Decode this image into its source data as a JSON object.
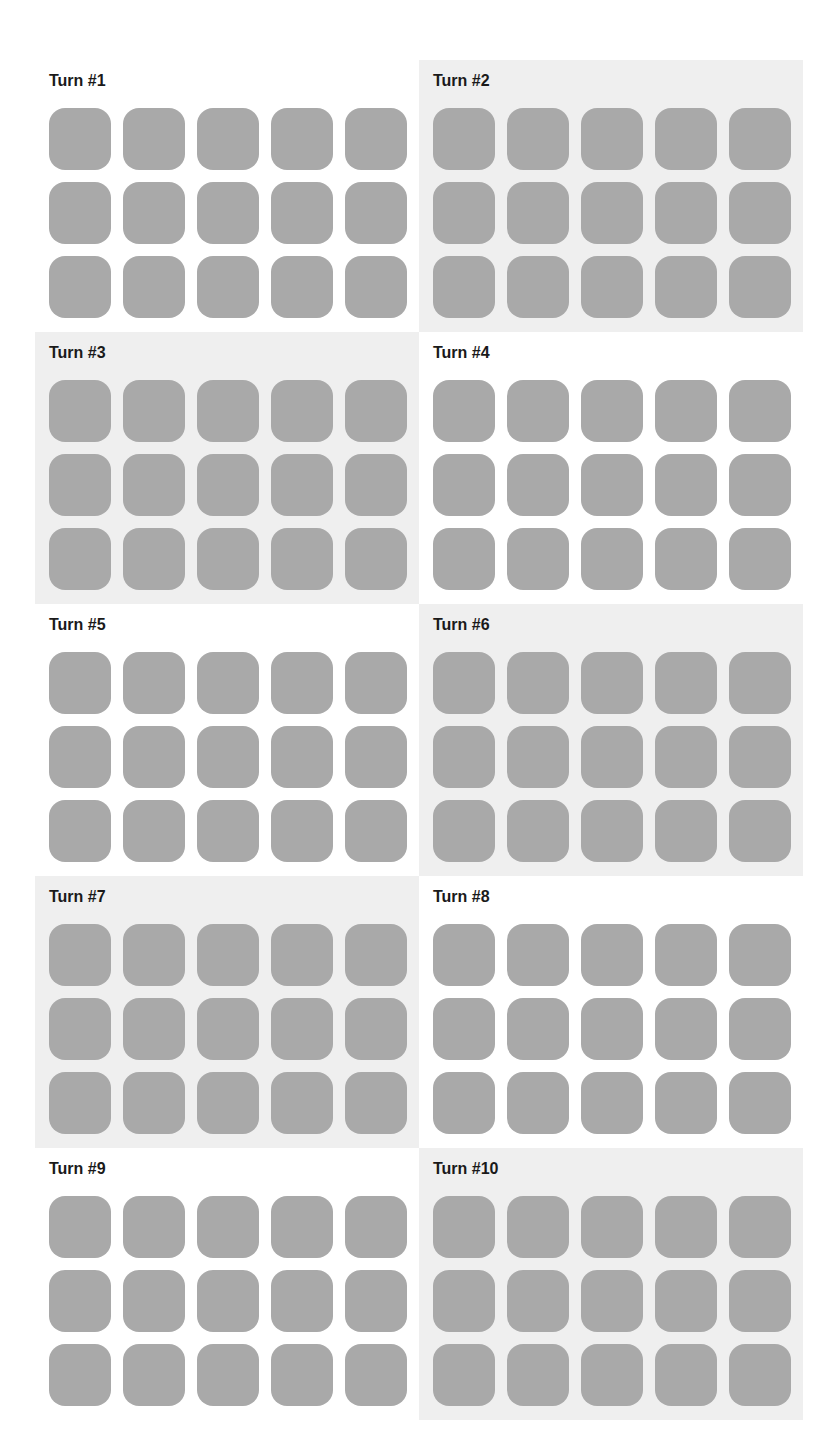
{
  "colors": {
    "tile": "#a9a9a9",
    "panel_shaded": "#efefef",
    "panel_plain": "#ffffff",
    "title": "#1a1a1a"
  },
  "panels": [
    {
      "title": "Turn #1",
      "shaded": false
    },
    {
      "title": "Turn #2",
      "shaded": true
    },
    {
      "title": "Turn #3",
      "shaded": true
    },
    {
      "title": "Turn #4",
      "shaded": false
    },
    {
      "title": "Turn #5",
      "shaded": false
    },
    {
      "title": "Turn #6",
      "shaded": true
    },
    {
      "title": "Turn #7",
      "shaded": true
    },
    {
      "title": "Turn #8",
      "shaded": false
    },
    {
      "title": "Turn #9",
      "shaded": false
    },
    {
      "title": "Turn #10",
      "shaded": true
    }
  ],
  "tile_grid": {
    "rows": 3,
    "cols": 5
  }
}
